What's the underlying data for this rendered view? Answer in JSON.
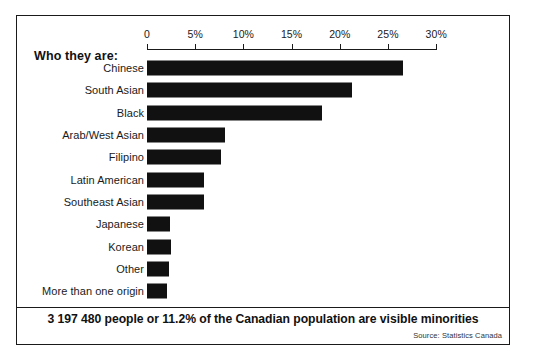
{
  "figure": {
    "header_label": "Who they are:",
    "caption": "3 197 480 people or 11.2% of the Canadian population are visible minorities",
    "source": "Source: Statistics Canada"
  },
  "chart_data": {
    "type": "bar",
    "orientation": "horizontal",
    "title": "Who they are:",
    "xlabel": "",
    "ylabel": "",
    "xlim": [
      0,
      30
    ],
    "grid": false,
    "legend": false,
    "axis_ticks": [
      {
        "value": 0,
        "label": "0"
      },
      {
        "value": 5,
        "label": "5%"
      },
      {
        "value": 10,
        "label": "10%"
      },
      {
        "value": 15,
        "label": "15%"
      },
      {
        "value": 20,
        "label": "20%"
      },
      {
        "value": 25,
        "label": "25%"
      },
      {
        "value": 30,
        "label": "30%"
      }
    ],
    "categories": [
      "Chinese",
      "South Asian",
      "Black",
      "Arab/West Asian",
      "Filipino",
      "Latin American",
      "Southeast Asian",
      "Japanese",
      "Korean",
      "Other",
      "More than one origin"
    ],
    "values": [
      26.6,
      21.3,
      18.2,
      8.1,
      7.7,
      5.9,
      5.9,
      2.4,
      2.5,
      2.3,
      2.1
    ],
    "bar_color": "#111111",
    "annotation": "3 197 480 people or 11.2% of the Canadian population are visible minorities",
    "source": "Source: Statistics Canada"
  }
}
